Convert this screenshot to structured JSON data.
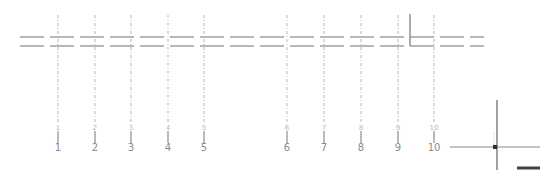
{
  "drawing": {
    "background": "#ffffff",
    "line_color": "#a0a0a0",
    "grid_line_color": "#b4b4b4",
    "cursor_color": "#606060",
    "horizontal_walls": [
      {
        "y": 37,
        "x1": 20,
        "x2": 484
      },
      {
        "y": 46,
        "x1": 20,
        "x2": 484
      }
    ],
    "grid_top": 15,
    "grid_bottom": 123,
    "axes": [
      {
        "x": 58,
        "small": "1",
        "label": "1"
      },
      {
        "x": 95,
        "small": "2",
        "label": "2"
      },
      {
        "x": 131,
        "small": "3",
        "label": "3"
      },
      {
        "x": 168,
        "small": "4",
        "label": "4"
      },
      {
        "x": 204,
        "small": "5",
        "label": "5"
      },
      {
        "x": 287,
        "small": "6",
        "label": "6"
      },
      {
        "x": 324,
        "small": "7",
        "label": "7"
      },
      {
        "x": 361,
        "small": "8",
        "label": "8"
      },
      {
        "x": 398,
        "small": "9",
        "label": "9"
      },
      {
        "x": 434,
        "small": "10",
        "label": "10"
      }
    ],
    "solid_marker": {
      "x": 410,
      "y1": 14,
      "y2": 46
    },
    "cursor": {
      "x": 497,
      "y": 147,
      "h_x1": 450,
      "h_x2": 540,
      "v_y1": 100,
      "v_y2": 170
    },
    "scale_bar": {
      "x1": 517,
      "x2": 540,
      "y": 168
    }
  }
}
